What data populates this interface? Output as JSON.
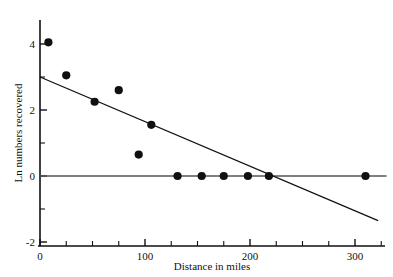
{
  "chart_data": {
    "type": "scatter",
    "title": "",
    "xlabel": "Distance in miles",
    "ylabel": "Ln numbers recovered",
    "xlim": [
      -10,
      330
    ],
    "ylim": [
      -2,
      4.6
    ],
    "grid": false,
    "legend": "none",
    "x_ticks_major": [
      0,
      100,
      200,
      300
    ],
    "x_tick_labels": [
      "0",
      "100",
      "200",
      "300"
    ],
    "x_ticks_minor": [
      25,
      50,
      75,
      125,
      150,
      175,
      225,
      250,
      275,
      325
    ],
    "y_ticks_major": [
      -2,
      0,
      2,
      4
    ],
    "y_tick_labels": [
      "-2",
      "0",
      "2",
      "4"
    ],
    "y_ticks_minor": [
      -1,
      1,
      3
    ],
    "points": [
      {
        "x": 8,
        "y": 4.05
      },
      {
        "x": 25,
        "y": 3.05
      },
      {
        "x": 52,
        "y": 2.25
      },
      {
        "x": 75,
        "y": 2.6
      },
      {
        "x": 94,
        "y": 0.65
      },
      {
        "x": 106,
        "y": 1.55
      },
      {
        "x": 131,
        "y": 0
      },
      {
        "x": 154,
        "y": 0
      },
      {
        "x": 175,
        "y": 0
      },
      {
        "x": 198,
        "y": 0
      },
      {
        "x": 218,
        "y": 0
      },
      {
        "x": 310,
        "y": 0
      }
    ],
    "trend_line": {
      "x_start": 0,
      "y_start": 3.0,
      "x_end": 322,
      "y_end": -1.35,
      "intercept": 3.0,
      "slope": -0.0135
    },
    "zero_reference_line": {
      "y": 0,
      "x_start": 0,
      "x_end": 330
    },
    "colors": {
      "point": "#101010",
      "axis": "#111111",
      "trend": "#111111",
      "zero": "#555555",
      "background": "#ffffff"
    }
  }
}
